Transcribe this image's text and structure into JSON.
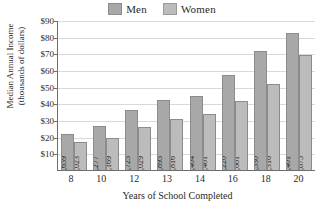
{
  "chart_data": {
    "type": "bar",
    "title": "",
    "xlabel": "Years of School Completed",
    "ylabel_lines": [
      "Median Annual Income",
      "(thousands of dollars)"
    ],
    "categories": [
      "8",
      "10",
      "12",
      "13",
      "14",
      "16",
      "18",
      "20"
    ],
    "series": [
      {
        "name": "Men",
        "color": "#a8a8a8",
        "values": [
          21659,
          26277,
          35725,
          41895,
          44404,
          57220,
          71530,
          82401
        ],
        "labels": [
          "21,659",
          "26,277",
          "35,725",
          "41,895",
          "44,404",
          "57,220",
          "71,530",
          "82,401"
        ]
      },
      {
        "name": "Women",
        "color": "#bcbcbc",
        "values": [
          17023,
          19169,
          26029,
          30816,
          33481,
          41681,
          51316,
          68875
        ],
        "labels": [
          "17,023",
          "19,169",
          "26,029",
          "30,816",
          "33,481",
          "41,681",
          "51,316",
          "68,875"
        ]
      }
    ],
    "ylim": [
      0,
      90000
    ],
    "ytick_values": [
      10000,
      20000,
      30000,
      40000,
      50000,
      60000,
      70000,
      80000,
      90000
    ],
    "ytick_labels": [
      "$10",
      "$20",
      "$30",
      "$40",
      "$50",
      "$60",
      "$70",
      "$80",
      "$90"
    ],
    "grid": true,
    "legend_position": "top-center"
  },
  "legend": {
    "entries": [
      {
        "label": "Men",
        "color": "#a8a8a8"
      },
      {
        "label": "Women",
        "color": "#bcbcbc"
      }
    ]
  }
}
